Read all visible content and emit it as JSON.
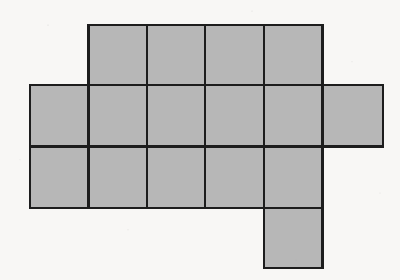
{
  "figure": {
    "kind": "polyomino-grid",
    "cell_count": 16,
    "background_color": "#f8f7f5",
    "fill_color": "#b7b7b7",
    "stroke_color": "#1d1d1d",
    "stroke_width": 2.2,
    "geometry": {
      "column_edges": [
        30,
        88.4,
        146.8,
        205.2,
        263.6,
        322.5,
        383
      ],
      "row_edges": [
        25,
        85,
        146.5,
        208,
        268
      ],
      "columns": 6,
      "rows": 4
    },
    "rows": [
      {
        "index": 0,
        "name": "top-row",
        "y_top": 25,
        "y_bottom": 85,
        "filled_columns": [
          1,
          2,
          3,
          4
        ],
        "cell_count": 4
      },
      {
        "index": 1,
        "name": "upper-middle-row",
        "y_top": 85,
        "y_bottom": 146.5,
        "filled_columns": [
          0,
          1,
          2,
          3,
          4,
          5
        ],
        "cell_count": 6
      },
      {
        "index": 2,
        "name": "lower-middle-row",
        "y_top": 146.5,
        "y_bottom": 208,
        "filled_columns": [
          0,
          1,
          2,
          3,
          4
        ],
        "cell_count": 5
      },
      {
        "index": 3,
        "name": "bottom-tab-row",
        "y_top": 208,
        "y_bottom": 268,
        "filled_columns": [
          4
        ],
        "cell_count": 1
      }
    ]
  }
}
